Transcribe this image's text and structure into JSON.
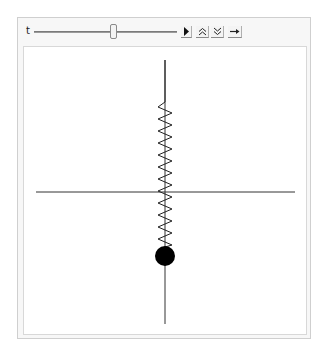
{
  "manipulate": {
    "slider": {
      "label": "t",
      "value_fraction": 0.53
    },
    "buttons": {
      "play": {
        "icon": "play-icon",
        "glyph": "▶"
      },
      "faster": {
        "icon": "double-chevron-up-icon",
        "glyph": "≈"
      },
      "slower": {
        "icon": "double-chevron-down-icon",
        "glyph": "≈"
      },
      "direction": {
        "icon": "arrow-right-icon",
        "glyph": "→"
      }
    }
  },
  "plot": {
    "axes": {
      "vertical": {
        "x": 158,
        "y1": 13,
        "y2": 277
      },
      "horizontal": {
        "y": 145,
        "x1": 12,
        "x2": 271
      }
    },
    "spring": {
      "top_line_y": 55,
      "zigzag_start_y": 55,
      "zigzag_end_y": 199,
      "left_x": 151,
      "right_x": 166,
      "coils": 12
    },
    "mass": {
      "cx": 158,
      "cy": 208,
      "r": 10,
      "color": "#000000"
    },
    "colors": {
      "axis": "#333333",
      "spring": "#222222"
    }
  }
}
